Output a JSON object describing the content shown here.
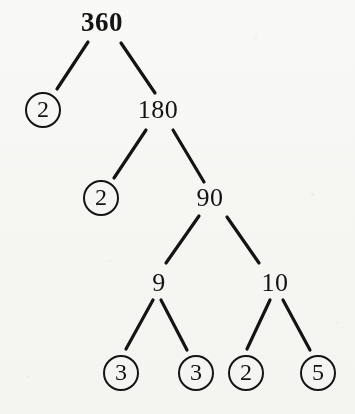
{
  "diagram": {
    "kind": "factor-tree",
    "title": "360",
    "ink_color": "#141414",
    "paper_color": "#fbfbfa",
    "nodes": [
      {
        "id": "n360",
        "label": "360",
        "circled": false,
        "root": true,
        "cx": 102,
        "cy": 22
      },
      {
        "id": "n2a",
        "label": "2",
        "circled": true,
        "root": false,
        "cx": 43,
        "cy": 110
      },
      {
        "id": "n180",
        "label": "180",
        "circled": false,
        "root": false,
        "cx": 158,
        "cy": 110
      },
      {
        "id": "n2b",
        "label": "2",
        "circled": true,
        "root": false,
        "cx": 101,
        "cy": 198
      },
      {
        "id": "n90",
        "label": "90",
        "circled": false,
        "root": false,
        "cx": 210,
        "cy": 198
      },
      {
        "id": "n9",
        "label": "9",
        "circled": false,
        "root": false,
        "cx": 159,
        "cy": 283
      },
      {
        "id": "n10",
        "label": "10",
        "circled": false,
        "root": false,
        "cx": 275,
        "cy": 283
      },
      {
        "id": "n3a",
        "label": "3",
        "circled": true,
        "root": false,
        "cx": 121,
        "cy": 373
      },
      {
        "id": "n3b",
        "label": "3",
        "circled": true,
        "root": false,
        "cx": 196,
        "cy": 373
      },
      {
        "id": "n2c",
        "label": "2",
        "circled": true,
        "root": false,
        "cx": 246,
        "cy": 373
      },
      {
        "id": "n5",
        "label": "5",
        "circled": true,
        "root": false,
        "cx": 318,
        "cy": 373
      }
    ],
    "edges": [
      {
        "id": "e-360-2a",
        "from": "n360",
        "to": "n2a",
        "x1": 88,
        "y1": 42,
        "x2": 57,
        "y2": 89
      },
      {
        "id": "e-360-180",
        "from": "n360",
        "to": "n180",
        "x1": 121,
        "y1": 43,
        "x2": 155,
        "y2": 93
      },
      {
        "id": "e-180-2b",
        "from": "n180",
        "to": "n2b",
        "x1": 146,
        "y1": 130,
        "x2": 114,
        "y2": 178
      },
      {
        "id": "e-180-90",
        "from": "n180",
        "to": "n90",
        "x1": 173,
        "y1": 130,
        "x2": 204,
        "y2": 182
      },
      {
        "id": "e-90-9",
        "from": "n90",
        "to": "n9",
        "x1": 199,
        "y1": 216,
        "x2": 166,
        "y2": 263
      },
      {
        "id": "e-90-10",
        "from": "n90",
        "to": "n10",
        "x1": 227,
        "y1": 217,
        "x2": 259,
        "y2": 263
      },
      {
        "id": "e-9-3a",
        "from": "n9",
        "to": "n3a",
        "x1": 153,
        "y1": 300,
        "x2": 126,
        "y2": 349
      },
      {
        "id": "e-9-3b",
        "from": "n9",
        "to": "n3b",
        "x1": 161,
        "y1": 300,
        "x2": 187,
        "y2": 350
      },
      {
        "id": "e-10-2c",
        "from": "n10",
        "to": "n2c",
        "x1": 270,
        "y1": 300,
        "x2": 247,
        "y2": 349
      },
      {
        "id": "e-10-5",
        "from": "n10",
        "to": "n5",
        "x1": 283,
        "y1": 300,
        "x2": 310,
        "y2": 350
      }
    ]
  }
}
